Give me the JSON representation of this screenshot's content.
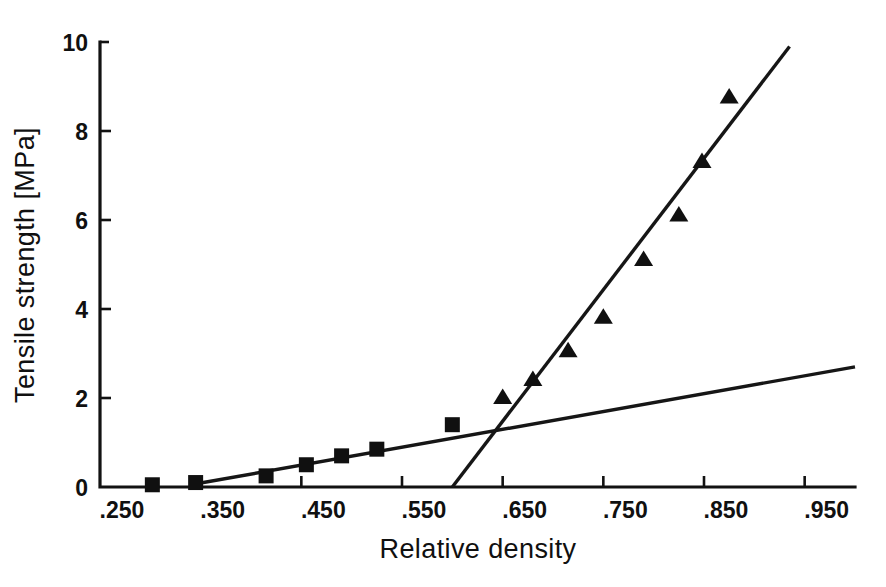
{
  "chart_data": {
    "type": "scatter",
    "title": "",
    "xlabel": "Relative density",
    "ylabel": "Tensile strength [MPa]",
    "xlim": [
      0.25,
      1.0
    ],
    "ylim": [
      0,
      10
    ],
    "grid": false,
    "legend": "none",
    "xticks": [
      {
        "value": 0.25,
        "label": ".250"
      },
      {
        "value": 0.35,
        "label": ".350"
      },
      {
        "value": 0.45,
        "label": ".450"
      },
      {
        "value": 0.55,
        "label": ".550"
      },
      {
        "value": 0.65,
        "label": ".650"
      },
      {
        "value": 0.75,
        "label": ".750"
      },
      {
        "value": 0.85,
        "label": ".850"
      },
      {
        "value": 0.95,
        "label": ".950"
      }
    ],
    "yticks": [
      {
        "value": 0,
        "label": "0"
      },
      {
        "value": 2,
        "label": "2"
      },
      {
        "value": 4,
        "label": "4"
      },
      {
        "value": 6,
        "label": "6"
      },
      {
        "value": 8,
        "label": "8"
      },
      {
        "value": 10,
        "label": "10"
      }
    ],
    "series": [
      {
        "name": "low-density-series",
        "marker": "square",
        "color": "#101010",
        "points": [
          {
            "x": 0.302,
            "y": 0.05
          },
          {
            "x": 0.345,
            "y": 0.1
          },
          {
            "x": 0.415,
            "y": 0.25
          },
          {
            "x": 0.455,
            "y": 0.5
          },
          {
            "x": 0.49,
            "y": 0.7
          },
          {
            "x": 0.525,
            "y": 0.85
          },
          {
            "x": 0.6,
            "y": 1.4
          }
        ]
      },
      {
        "name": "high-density-series",
        "marker": "triangle",
        "color": "#101010",
        "points": [
          {
            "x": 0.65,
            "y": 2.0
          },
          {
            "x": 0.68,
            "y": 2.4
          },
          {
            "x": 0.715,
            "y": 3.05
          },
          {
            "x": 0.75,
            "y": 3.8
          },
          {
            "x": 0.79,
            "y": 5.1
          },
          {
            "x": 0.825,
            "y": 6.1
          },
          {
            "x": 0.848,
            "y": 7.3
          },
          {
            "x": 0.875,
            "y": 8.75
          }
        ]
      }
    ],
    "fit_lines": [
      {
        "name": "shallow-fit-line",
        "color": "#161616",
        "x1": 0.34,
        "y1": 0.05,
        "x2": 1.0,
        "y2": 2.7
      },
      {
        "name": "steep-fit-line",
        "color": "#161616",
        "x1": 0.6,
        "y1": 0.0,
        "x2": 0.935,
        "y2": 9.9
      }
    ]
  }
}
